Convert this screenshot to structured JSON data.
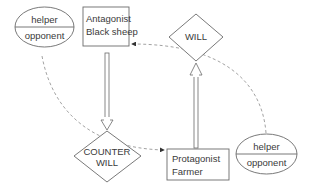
{
  "diagram": {
    "type": "actantial-model",
    "nodes": {
      "helper_opponent_left": {
        "top": "helper",
        "bottom": "opponent"
      },
      "antagonist": {
        "line1": "Antagonist",
        "line2": "Black sheep"
      },
      "will": {
        "label": "WILL"
      },
      "counter_will": {
        "line1": "COUNTER",
        "line2": "WILL"
      },
      "protagonist": {
        "line1": "Protagonist",
        "line2": "Farmer"
      },
      "helper_opponent_right": {
        "top": "helper",
        "bottom": "opponent"
      }
    },
    "edges": [
      {
        "from": "antagonist",
        "to": "counter_will",
        "style": "double-arrow"
      },
      {
        "from": "protagonist",
        "to": "will",
        "style": "double-arrow"
      },
      {
        "from": "helper_opponent_left",
        "to": "protagonist",
        "style": "dashed-arrow"
      },
      {
        "from": "helper_opponent_right",
        "to": "antagonist",
        "style": "dashed-arrow"
      }
    ],
    "colors": {
      "stroke": "#6a6a6a",
      "dash": "#8a8a8a",
      "text": "#3a3a3a",
      "background": "#ffffff"
    }
  }
}
